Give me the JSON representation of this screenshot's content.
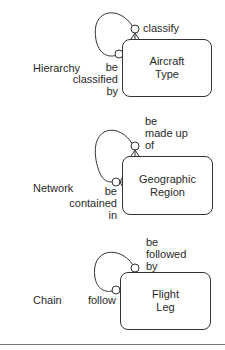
{
  "diagram": {
    "type": "entity-relationship recursive relationship patterns",
    "patterns": [
      {
        "name": "Hierarchy",
        "entity": "Aircraft Type",
        "entity_lines": [
          "Aircraft",
          "Type"
        ],
        "top_role_lines": [
          "classify"
        ],
        "left_role_lines": [
          "be",
          "classified",
          "by"
        ],
        "top_end": "optional-many",
        "left_end": "optional-one"
      },
      {
        "name": "Network",
        "entity": "Geographic Region",
        "entity_lines": [
          "Geographic",
          "Region"
        ],
        "top_role_lines": [
          "be",
          "made up",
          "of"
        ],
        "left_role_lines": [
          "be",
          "contained",
          "in"
        ],
        "top_end": "optional-many",
        "left_end": "optional-many"
      },
      {
        "name": "Chain",
        "entity": "Flight Leg",
        "entity_lines": [
          "Flight",
          "Leg"
        ],
        "top_role_lines": [
          "be",
          "followed",
          "by"
        ],
        "left_role_lines": [
          "follow"
        ],
        "top_end": "optional-one",
        "left_end": "optional-one"
      }
    ]
  },
  "colors": {
    "line": "#333333",
    "text": "#2a2a2a",
    "rule": "#777777"
  }
}
